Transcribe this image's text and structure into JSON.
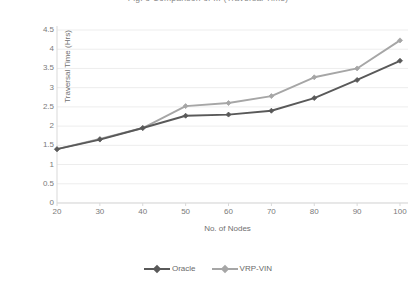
{
  "chart_data": {
    "type": "line",
    "title": "Fig. 8  Comparison of ... (Traversal Time)",
    "xlabel": "No. of Nodes",
    "ylabel": "Traversal Time (Hrs)",
    "categories": [
      20,
      30,
      40,
      50,
      60,
      70,
      80,
      90,
      100
    ],
    "x_tick_labels": [
      "20",
      "30",
      "40",
      "50",
      "60",
      "70",
      "80",
      "90",
      "100"
    ],
    "y_tick_labels": [
      "0",
      "0.5",
      "1",
      "1.5",
      "2",
      "2.5",
      "3",
      "3.5",
      "4",
      "4.5"
    ],
    "y_tick_values": [
      0,
      0.5,
      1,
      1.5,
      2,
      2.5,
      3,
      3.5,
      4,
      4.5
    ],
    "ylim": [
      0,
      4.5
    ],
    "xlim": [
      20,
      100
    ],
    "grid": "horizontal",
    "legend_position": "bottom",
    "series": [
      {
        "name": "Oracle",
        "color": "#595959",
        "marker": "diamond",
        "values": [
          1.4,
          1.65,
          1.95,
          2.27,
          2.3,
          2.4,
          2.73,
          3.2,
          3.7
        ]
      },
      {
        "name": "VRP-VIN",
        "color": "#a6a6a6",
        "marker": "diamond",
        "values": [
          1.4,
          1.67,
          1.95,
          2.52,
          2.6,
          2.78,
          3.27,
          3.5,
          4.23
        ]
      }
    ]
  },
  "colors": {
    "background": "#ffffff",
    "grid": "#ededed",
    "axis": "#d9d9d9",
    "text": "#7a7a7a"
  }
}
